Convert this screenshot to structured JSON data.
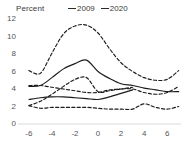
{
  "chart_data": {
    "type": "line",
    "title": "",
    "ylabel": "Percent",
    "xlabel": "",
    "ylim": [
      0,
      12
    ],
    "xlim": [
      -6.6,
      7.2
    ],
    "grid": false,
    "legend_position": "top-center",
    "y_ticks": [
      "12",
      "10",
      "8",
      "6",
      "4",
      "2",
      "0"
    ],
    "x_ticks": [
      "-6",
      "-4",
      "-2",
      "0",
      "2",
      "4",
      "6"
    ],
    "legend": [
      {
        "name": "2009",
        "style": "solid"
      },
      {
        "name": "2020",
        "style": "dashed"
      }
    ],
    "x": [
      -6,
      -5,
      -4,
      -3,
      -2,
      -1,
      0,
      1,
      2,
      3,
      4,
      5,
      6,
      7
    ],
    "series": [
      {
        "name": "2020 upper",
        "style": "dashed",
        "x": [
          -6,
          -5,
          -4,
          -3,
          -2,
          -1,
          0,
          1,
          2,
          3,
          4,
          5,
          6,
          7
        ],
        "values": [
          6.1,
          5.8,
          8.1,
          10.3,
          11.2,
          11.3,
          10.4,
          8.6,
          7.0,
          6.0,
          5.3,
          5.0,
          5.1,
          6.1
        ]
      },
      {
        "name": "2009 upper",
        "style": "solid",
        "x": [
          -6,
          -5,
          -4,
          -3,
          -2,
          -1,
          0,
          1,
          2,
          3,
          4,
          5,
          6,
          7
        ],
        "values": [
          4.3,
          4.4,
          5.3,
          6.3,
          6.9,
          7.3,
          6.0,
          5.2,
          4.6,
          4.4,
          4.1,
          3.9,
          3.7,
          3.7
        ]
      },
      {
        "name": "2020 middle",
        "style": "dashed",
        "x": [
          -6,
          -5,
          -4,
          -3,
          -2,
          -1,
          0,
          1,
          2,
          3,
          4,
          5,
          6,
          7
        ],
        "values": [
          2.1,
          2.6,
          3.4,
          4.3,
          5.1,
          5.3,
          3.7,
          3.8,
          4.0,
          4.0,
          3.6,
          3.4,
          3.6,
          4.3
        ]
      },
      {
        "name": "2009 middle",
        "style": "solid",
        "x": [
          -6,
          -5,
          -4,
          -3,
          -2,
          -1,
          0,
          1,
          2,
          3
        ],
        "values": [
          2.8,
          3.0,
          3.1,
          3.1,
          3.0,
          2.9,
          2.8,
          3.1,
          3.5,
          3.9
        ]
      },
      {
        "name": "2020 lower-band",
        "style": "dashed",
        "x": [
          -6,
          -5,
          -4,
          -3,
          -2,
          -1,
          0,
          1,
          2,
          3
        ],
        "values": [
          4.4,
          4.4,
          4.2,
          4.0,
          3.8,
          3.6,
          3.6,
          3.9,
          4.0,
          4.2
        ]
      },
      {
        "name": "2009 lower",
        "style": "dashed",
        "x": [
          -6,
          -5,
          -4,
          -3,
          -2,
          -1,
          0,
          1,
          2,
          3,
          4,
          5,
          6,
          7
        ],
        "values": [
          2.1,
          1.8,
          1.9,
          1.9,
          1.9,
          1.9,
          1.8,
          1.7,
          1.7,
          1.7,
          2.3,
          1.9,
          1.7,
          2.0
        ]
      }
    ]
  }
}
